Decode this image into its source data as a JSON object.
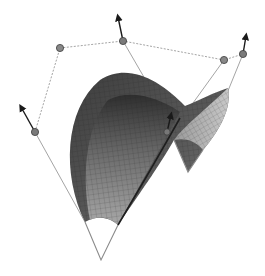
{
  "figure": {
    "type": "3d-surface-patch-with-control-polygon",
    "background": "#ffffff",
    "colors": {
      "surface_dark": "#3a3a3a",
      "surface_mid": "#6e6e6e",
      "surface_light": "#b4b4b4",
      "mesh_line": "#2a2a2a",
      "control_polygon": "#9a9a9a",
      "control_point_fill": "#7a7a7a",
      "control_point_stroke": "#3c3c3c",
      "arrow": "#1a1a1a",
      "boundary_edge": "#8a8a8a"
    },
    "control_points": [
      {
        "id": "p-left",
        "x": 35,
        "y": 132,
        "normal_tip": [
          20,
          104
        ]
      },
      {
        "id": "p-top-left",
        "x": 60,
        "y": 48
      },
      {
        "id": "p-top",
        "x": 123,
        "y": 41,
        "normal_tip": [
          117,
          14
        ]
      },
      {
        "id": "p-right-inner",
        "x": 224,
        "y": 60
      },
      {
        "id": "p-right",
        "x": 243,
        "y": 54,
        "normal_tip": [
          247,
          33
        ]
      },
      {
        "id": "p-center",
        "x": 167,
        "y": 132,
        "normal_tip": [
          172,
          112
        ]
      }
    ]
  }
}
